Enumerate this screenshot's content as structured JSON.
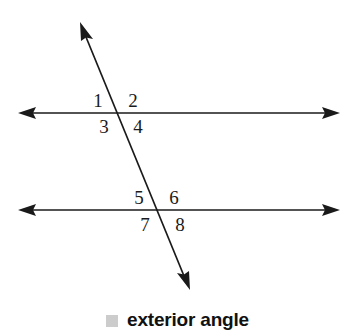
{
  "figure": {
    "type": "geometry-diagram",
    "background_color": "#ffffff",
    "line_color": "#1a1a1a",
    "lines": [
      {
        "name": "upper-parallel-line",
        "orientation": "horizontal",
        "x1": 18,
        "y1": 113,
        "x2": 340,
        "y2": 113,
        "arrow_start": true,
        "arrow_end": true
      },
      {
        "name": "lower-parallel-line",
        "orientation": "horizontal",
        "x1": 18,
        "y1": 210,
        "x2": 340,
        "y2": 210,
        "arrow_start": true,
        "arrow_end": true
      },
      {
        "name": "transversal-line",
        "orientation": "oblique",
        "x1": 80,
        "y1": 22,
        "x2": 190,
        "y2": 290,
        "arrow_start": true,
        "arrow_end": true
      }
    ],
    "intersections": [
      {
        "name": "upper-intersection",
        "x": 117,
        "y": 113
      },
      {
        "name": "lower-intersection",
        "x": 158,
        "y": 210
      }
    ],
    "angle_labels": [
      {
        "id": 1,
        "text": "1",
        "x": 98,
        "y": 107,
        "position": "upper-left",
        "intersection": "upper-intersection"
      },
      {
        "id": 2,
        "text": "2",
        "x": 133,
        "y": 107,
        "position": "upper-right",
        "intersection": "upper-intersection"
      },
      {
        "id": 3,
        "text": "3",
        "x": 104,
        "y": 133,
        "position": "lower-left",
        "intersection": "upper-intersection"
      },
      {
        "id": 4,
        "text": "4",
        "x": 138,
        "y": 133,
        "position": "lower-right",
        "intersection": "upper-intersection"
      },
      {
        "id": 5,
        "text": "5",
        "x": 139,
        "y": 204,
        "position": "upper-left",
        "intersection": "lower-intersection"
      },
      {
        "id": 6,
        "text": "6",
        "x": 174,
        "y": 204,
        "position": "upper-right",
        "intersection": "lower-intersection"
      },
      {
        "id": 7,
        "text": "7",
        "x": 145,
        "y": 231,
        "position": "lower-left",
        "intersection": "lower-intersection"
      },
      {
        "id": 8,
        "text": "8",
        "x": 180,
        "y": 231,
        "position": "lower-right",
        "intersection": "lower-intersection"
      }
    ]
  },
  "caption": {
    "marker_icon": "gray-square-swatch",
    "marker_color": "#cccccc",
    "label": "exterior angle"
  }
}
